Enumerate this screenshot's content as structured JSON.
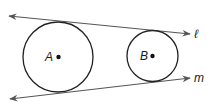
{
  "diagram": {
    "circles": [
      {
        "label": "A",
        "cx": 58,
        "cy": 57,
        "r": 35
      },
      {
        "label": "B",
        "cx": 152.5,
        "cy": 56,
        "r": 25.5
      }
    ],
    "lines": [
      {
        "label": "ℓ",
        "x1": 9,
        "y1": 16,
        "x2": 190,
        "y2": 34
      },
      {
        "label": "m",
        "x1": 10,
        "y1": 99,
        "x2": 190,
        "y2": 78
      }
    ],
    "colors": {
      "stroke": "#222222",
      "line": "#555555"
    }
  }
}
